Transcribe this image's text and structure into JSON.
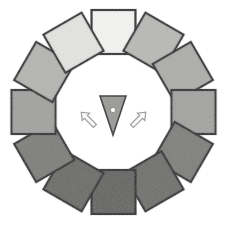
{
  "canvas": {
    "width": 227,
    "height": 229,
    "background": "#ffffff"
  },
  "figure": {
    "center_x": 113.5,
    "center_y": 112,
    "ring_radius": 80,
    "square_size": 44,
    "square_count": 12,
    "outline_color": "#262626",
    "outline_width": 2.2
  },
  "ring": {
    "name": "square-ring",
    "squares": [
      {
        "index": 0,
        "label": "square-12-oclock",
        "angle_deg": 0,
        "rotation_deg": 0,
        "fill": "#f4f4f2"
      },
      {
        "index": 1,
        "label": "square-1-oclock",
        "angle_deg": 30,
        "rotation_deg": 30,
        "fill": "#b9b9b7"
      },
      {
        "index": 2,
        "label": "square-2-oclock",
        "angle_deg": 60,
        "rotation_deg": 60,
        "fill": "#adadab"
      },
      {
        "index": 3,
        "label": "square-3-oclock",
        "angle_deg": 90,
        "rotation_deg": 90,
        "fill": "#a3a3a1"
      },
      {
        "index": 4,
        "label": "square-4-oclock",
        "angle_deg": 120,
        "rotation_deg": 120,
        "fill": "#7e7e7c"
      },
      {
        "index": 5,
        "label": "square-5-oclock",
        "angle_deg": 150,
        "rotation_deg": 150,
        "fill": "#6e6e6c"
      },
      {
        "index": 6,
        "label": "square-6-oclock",
        "angle_deg": 180,
        "rotation_deg": 180,
        "fill": "#636361"
      },
      {
        "index": 7,
        "label": "square-7-oclock",
        "angle_deg": 210,
        "rotation_deg": 210,
        "fill": "#6a6a68"
      },
      {
        "index": 8,
        "label": "square-8-oclock",
        "angle_deg": 240,
        "rotation_deg": 240,
        "fill": "#7d7d7b"
      },
      {
        "index": 9,
        "label": "square-9-oclock",
        "angle_deg": 270,
        "rotation_deg": 270,
        "fill": "#a2a2a0"
      },
      {
        "index": 10,
        "label": "square-10-oclock",
        "angle_deg": 300,
        "rotation_deg": 300,
        "fill": "#b5b5b3"
      },
      {
        "index": 11,
        "label": "square-11-oclock",
        "angle_deg": 330,
        "rotation_deg": 330,
        "fill": "#e4e4e2"
      }
    ]
  },
  "center": {
    "pointer": {
      "name": "down-triangle-pointer",
      "fill": "#9a9a98",
      "outline": "#3a3a3a",
      "apex_x": 113,
      "apex_y": 135,
      "top_left_x": 100,
      "top_left_y": 96,
      "top_right_x": 126,
      "top_right_y": 96,
      "dot": {
        "name": "pivot-dot",
        "cx": 113,
        "cy": 110,
        "r": 2.6,
        "fill": "#ffffff",
        "outline": "#7d7d7b"
      }
    },
    "arrows": [
      {
        "name": "rotate-left-arrow",
        "direction": "up-left",
        "x": 89,
        "y": 120,
        "rotation_deg": -45,
        "stroke": "#9d9d9b",
        "fill": "#fbfbfb"
      },
      {
        "name": "rotate-right-arrow",
        "direction": "up-right",
        "x": 138,
        "y": 120,
        "rotation_deg": 45,
        "stroke": "#9d9d9b",
        "fill": "#fbfbfb"
      }
    ]
  }
}
